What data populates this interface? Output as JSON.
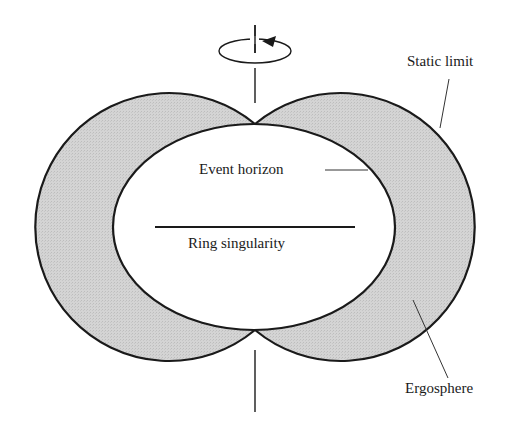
{
  "diagram": {
    "labels": {
      "static_limit": "Static limit",
      "event_horizon": "Event horizon",
      "ring_singularity": "Ring singularity",
      "ergosphere": "Ergosphere"
    },
    "colors": {
      "ergosphere_fill": "#d2d2d2",
      "outline": "#1a1a1a",
      "background": "#ffffff"
    },
    "icons": {
      "rotation": "rotation-arrow-icon"
    }
  }
}
